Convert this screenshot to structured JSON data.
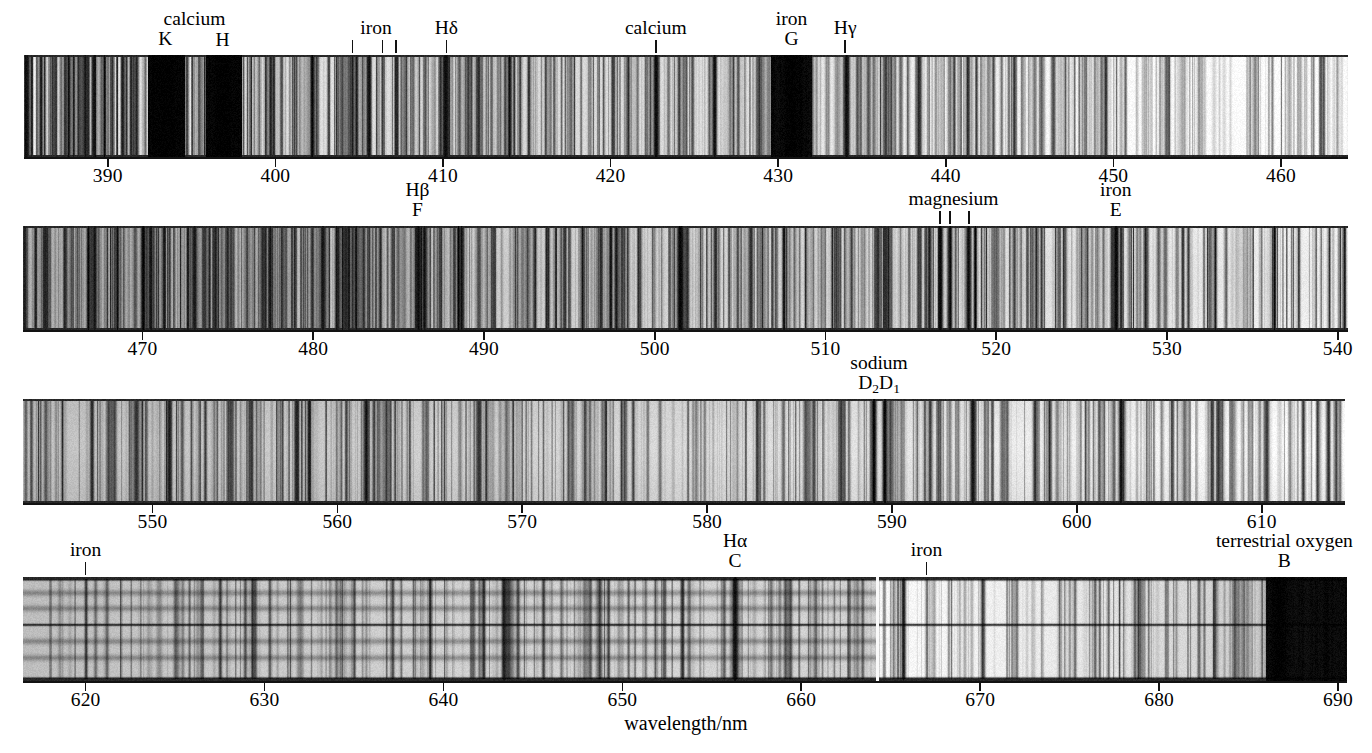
{
  "figure": {
    "type": "solar-absorption-spectrum",
    "xaxis_title": "wavelength/nm",
    "units": "nm"
  },
  "chart_data": {
    "type": "spectrum",
    "title": "",
    "xlabel": "wavelength/nm",
    "ylabel": "",
    "grid": false,
    "legend": null,
    "strips": [
      {
        "index": 1,
        "range_nm": [
          385.0,
          464.0
        ],
        "ticks": [
          390,
          400,
          410,
          420,
          430,
          440,
          450,
          460
        ],
        "tick_labels": [
          "390",
          "400",
          "410",
          "420",
          "430",
          "440",
          "450",
          "460"
        ],
        "annotations": [
          {
            "name": "calcium",
            "symbol": "K",
            "wavelength": 393.4,
            "marks": []
          },
          {
            "name": "",
            "symbol": "H",
            "wavelength": 396.8,
            "marks": []
          },
          {
            "name": "iron",
            "symbol": "",
            "wavelength": 406.0,
            "marks": [
              404.6,
              406.4,
              407.2
            ]
          },
          {
            "name": "",
            "symbol": "Hδ",
            "wavelength": 410.2,
            "marks": [
              410.2
            ]
          },
          {
            "name": "calcium",
            "symbol": "",
            "wavelength": 422.7,
            "marks": [
              422.7
            ]
          },
          {
            "name": "iron",
            "symbol": "G",
            "wavelength": 430.8,
            "marks": []
          },
          {
            "name": "",
            "symbol": "Hγ",
            "wavelength": 434.0,
            "marks": [
              434.0
            ]
          }
        ]
      },
      {
        "index": 2,
        "range_nm": [
          463.0,
          540.6
        ],
        "ticks": [
          470,
          480,
          490,
          500,
          510,
          520,
          530,
          540
        ],
        "tick_labels": [
          "470",
          "480",
          "490",
          "500",
          "510",
          "520",
          "530",
          "540"
        ],
        "annotations": [
          {
            "name": "",
            "symbol": "Hβ",
            "symbol2": "F",
            "wavelength": 486.1,
            "marks": []
          },
          {
            "name": "magnesium",
            "symbol": "",
            "wavelength": 517.5,
            "marks": [
              516.7,
              517.3,
              518.4
            ]
          },
          {
            "name": "iron",
            "symbol": "E",
            "wavelength": 527.0,
            "marks": []
          }
        ]
      },
      {
        "index": 3,
        "range_nm": [
          543.0,
          614.5
        ],
        "ticks": [
          550,
          560,
          570,
          580,
          590,
          600,
          610
        ],
        "tick_labels": [
          "550",
          "560",
          "570",
          "580",
          "590",
          "600",
          "610"
        ],
        "annotations": [
          {
            "name": "sodium",
            "symbol": "D₂D₁",
            "wavelength": 589.3,
            "marks": []
          }
        ]
      },
      {
        "index": 4,
        "range_nm": [
          616.5,
          690.5
        ],
        "ticks": [
          620,
          630,
          640,
          650,
          660,
          670,
          680,
          690
        ],
        "tick_labels": [
          "620",
          "630",
          "640",
          "650",
          "660",
          "670",
          "680",
          "690"
        ],
        "annotations": [
          {
            "name": "iron",
            "symbol": "",
            "wavelength": 620.0,
            "marks": [
              620.0
            ]
          },
          {
            "name": "",
            "symbol": "Hα",
            "symbol2": "C",
            "wavelength": 656.3,
            "marks": []
          },
          {
            "name": "iron",
            "symbol": "",
            "wavelength": 667.0,
            "marks": [
              667.0
            ]
          },
          {
            "name": "terrestrial oxygen",
            "symbol": "B",
            "wavelength": 687.0,
            "marks": []
          }
        ]
      }
    ]
  },
  "labels": {
    "calcium": "calcium",
    "iron": "iron",
    "magnesium": "magnesium",
    "sodium": "sodium",
    "terrestrial_oxygen": "terrestrial oxygen",
    "K": "K",
    "H": "H",
    "G": "G",
    "E": "E",
    "F": "F",
    "C": "C",
    "B": "B",
    "H_delta": "Hδ",
    "H_gamma": "Hγ",
    "H_beta": "Hβ",
    "H_alpha": "Hα",
    "sodium_D": "D₂D₁"
  }
}
